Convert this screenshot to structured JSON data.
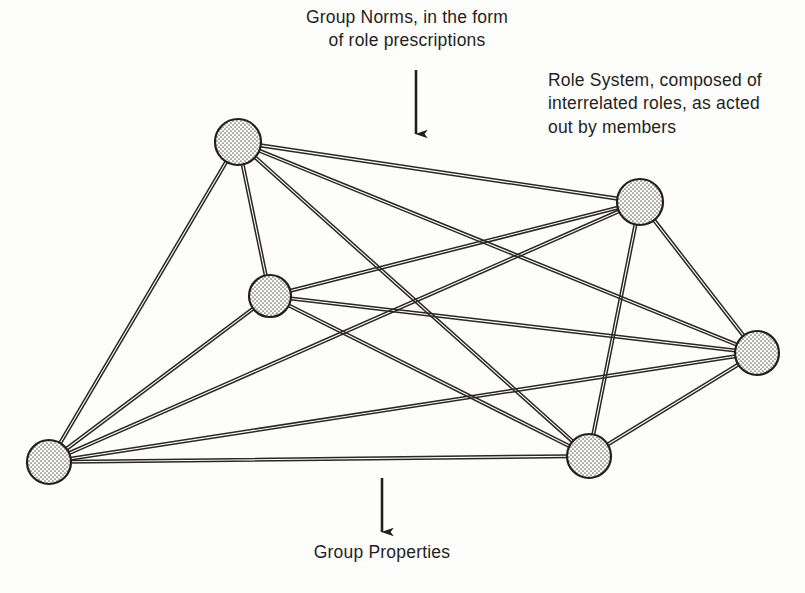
{
  "figure": {
    "background_color": "#fdfdfc",
    "ink_color": "#231f1d"
  },
  "annotations": {
    "top": {
      "text": "Group Norms, in the form\nof role prescriptions",
      "lines": [
        "Group Norms, in the form",
        "of role prescriptions"
      ],
      "align": "center"
    },
    "right": {
      "text": "Role System, composed of\ninterrelated roles, as acted\nout by members",
      "lines": [
        "Role System, composed of",
        "interrelated roles, as acted",
        "out by members"
      ],
      "align": "left"
    },
    "bottom": {
      "text": "Group Properties",
      "lines": [
        "Group Properties"
      ],
      "align": "center"
    }
  },
  "chart_data": {
    "type": "diagram",
    "subtype": "node-link-graph",
    "title": "Group Norms, in the form of role prescriptions",
    "node_count": 6,
    "edge_count": 15,
    "graph_kind": "complete graph K6",
    "node_style": {
      "fill": "stipple",
      "stipple_color": "#5d5953",
      "stipple_background": "#ffffff",
      "outline_color": "#231f1d",
      "outline_width": 2.2
    },
    "edge_style": {
      "rendering": "double-line",
      "line_color": "#2b2724",
      "line_width": 1.5,
      "gap": 2.6
    },
    "nodes": [
      {
        "id": "n1",
        "label": "",
        "x": 238,
        "y": 142,
        "r": 23
      },
      {
        "id": "n2",
        "label": "",
        "x": 640,
        "y": 202,
        "r": 23
      },
      {
        "id": "n3",
        "label": "",
        "x": 270,
        "y": 296,
        "r": 21
      },
      {
        "id": "n4",
        "label": "",
        "x": 757,
        "y": 353,
        "r": 22
      },
      {
        "id": "n5",
        "label": "",
        "x": 49,
        "y": 462,
        "r": 22
      },
      {
        "id": "n6",
        "label": "",
        "x": 589,
        "y": 456,
        "r": 22
      }
    ],
    "edges": [
      {
        "source": "n1",
        "target": "n2"
      },
      {
        "source": "n1",
        "target": "n3"
      },
      {
        "source": "n1",
        "target": "n4"
      },
      {
        "source": "n1",
        "target": "n5"
      },
      {
        "source": "n1",
        "target": "n6"
      },
      {
        "source": "n2",
        "target": "n3"
      },
      {
        "source": "n2",
        "target": "n4"
      },
      {
        "source": "n2",
        "target": "n5"
      },
      {
        "source": "n2",
        "target": "n6"
      },
      {
        "source": "n3",
        "target": "n4"
      },
      {
        "source": "n3",
        "target": "n5"
      },
      {
        "source": "n3",
        "target": "n6"
      },
      {
        "source": "n4",
        "target": "n5"
      },
      {
        "source": "n4",
        "target": "n6"
      },
      {
        "source": "n5",
        "target": "n6"
      }
    ],
    "arrows": [
      {
        "id": "arrow-group-norms",
        "label": "Group Norms, in the form of role prescriptions",
        "x1": 416,
        "y1": 70,
        "x2": 416,
        "y2": 134,
        "direction": "down",
        "points_to": "network"
      },
      {
        "id": "arrow-group-properties",
        "label": "Group Properties",
        "x1": 382,
        "y1": 478,
        "x2": 382,
        "y2": 532,
        "direction": "down",
        "points_to": "group-properties-label"
      }
    ]
  }
}
